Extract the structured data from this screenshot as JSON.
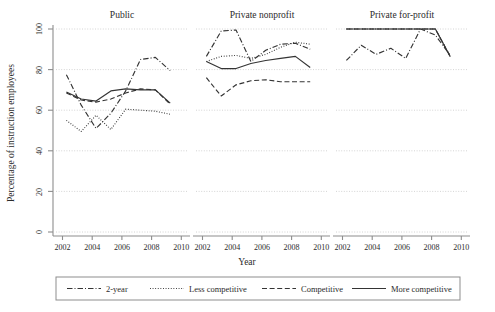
{
  "chart_data": {
    "type": "line",
    "title": "",
    "xlabel": "Year",
    "ylabel": "Percentage of instruction employees",
    "ylim": [
      0,
      100
    ],
    "xlim": [
      2001.3,
      2010.2
    ],
    "yticks": [
      0,
      20,
      40,
      60,
      80,
      100
    ],
    "xticks": [
      2002,
      2004,
      2006,
      2008,
      2010
    ],
    "grid": "horizontal-dotted",
    "legend_position": "bottom",
    "panels": [
      {
        "name": "Public",
        "title": "Public",
        "x": [
          2002,
          2003,
          2004,
          2005,
          2006,
          2007,
          2008,
          2009
        ],
        "series": [
          {
            "name": "2-year",
            "values": [
              77.5,
              62.5,
              51.0,
              58.5,
              69.5,
              85.0,
              86.0,
              79.5
            ]
          },
          {
            "name": "Less competitive",
            "values": [
              55.0,
              49.5,
              57.5,
              50.5,
              60.5,
              60.0,
              59.5,
              58.0
            ]
          },
          {
            "name": "Competitive",
            "values": [
              68.5,
              65.0,
              64.0,
              65.5,
              68.5,
              70.5,
              70.0,
              63.0
            ]
          },
          {
            "name": "More competitive",
            "values": [
              69.0,
              65.5,
              64.5,
              69.5,
              70.5,
              70.0,
              70.0,
              63.5
            ]
          }
        ]
      },
      {
        "name": "Private nonprofit",
        "title": "Private nonprofit",
        "x": [
          2002,
          2003,
          2004,
          2005,
          2006,
          2007,
          2008,
          2009
        ],
        "series": [
          {
            "name": "2-year",
            "values": [
              86.5,
              99.0,
              99.5,
              84.0,
              89.5,
              92.5,
              93.0,
              90.0
            ]
          },
          {
            "name": "Less competitive",
            "values": [
              84.0,
              86.5,
              87.0,
              85.5,
              87.5,
              91.0,
              93.5,
              92.5
            ]
          },
          {
            "name": "Competitive",
            "values": [
              76.0,
              67.0,
              72.5,
              74.5,
              75.0,
              74.0,
              74.0,
              74.0
            ]
          },
          {
            "name": "More competitive",
            "values": [
              84.0,
              80.5,
              80.5,
              83.0,
              84.5,
              85.5,
              86.5,
              81.0
            ]
          }
        ]
      },
      {
        "name": "Private for-profit",
        "title": "Private for-profit",
        "x": [
          2002,
          2003,
          2004,
          2005,
          2006,
          2007,
          2008,
          2009
        ],
        "series": [
          {
            "name": "2-year",
            "values": [
              84.5,
              92.0,
              87.5,
              90.5,
              85.5,
              100.0,
              97.0,
              87.0
            ]
          },
          {
            "name": "Less competitive",
            "values": [
              100.0,
              100.0,
              100.0,
              100.0,
              100.0,
              100.0,
              100.0,
              86.5
            ]
          },
          {
            "name": "Competitive",
            "values": [
              100.0,
              100.0,
              100.0,
              100.0,
              100.0,
              100.0,
              100.0,
              86.5
            ]
          },
          {
            "name": "More competitive",
            "values": [
              100.0,
              100.0,
              100.0,
              100.0,
              100.0,
              100.0,
              100.0,
              86.5
            ]
          }
        ]
      }
    ],
    "legend": [
      {
        "label": "2-year",
        "style": "dash-dot"
      },
      {
        "label": "Less competitive",
        "style": "dotted"
      },
      {
        "label": "Competitive",
        "style": "dashed"
      },
      {
        "label": "More competitive",
        "style": "solid"
      }
    ]
  },
  "labels": {
    "ytick_0": "0",
    "ytick_20": "20",
    "ytick_40": "40",
    "ytick_60": "60",
    "ytick_80": "80",
    "ytick_100": "100",
    "xtick_2002": "2002",
    "xtick_2004": "2004",
    "xtick_2006": "2006",
    "xtick_2008": "2008",
    "xtick_2010": "2010"
  }
}
